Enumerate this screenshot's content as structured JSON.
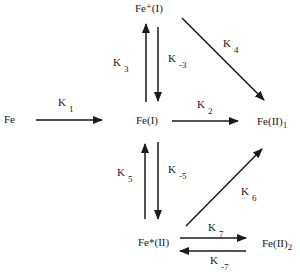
{
  "nodes": {
    "fe": "Fe",
    "fe_i": "Fe(I)",
    "fe_plus_i": "Fe⁺(I)",
    "fe_ii_1": "Fe(II)",
    "fe_ii_1_sub": "1",
    "fe_star_ii": "Fe*(II)",
    "fe_ii_2": "Fe(II)",
    "fe_ii_2_sub": "2"
  },
  "rate_constants": [
    {
      "id": "k1",
      "base": "K",
      "sub": "1",
      "from": "Fe",
      "to": "Fe(I)"
    },
    {
      "id": "k2",
      "base": "K",
      "sub": "2",
      "from": "Fe(I)",
      "to": "Fe(II)1"
    },
    {
      "id": "k3",
      "base": "K",
      "sub": "3",
      "from": "Fe(I)",
      "to": "Fe+(I)"
    },
    {
      "id": "k_3",
      "base": "K",
      "sub": "-3",
      "from": "Fe+(I)",
      "to": "Fe(I)"
    },
    {
      "id": "k4",
      "base": "K",
      "sub": "4",
      "from": "Fe+(I)",
      "to": "Fe(II)1"
    },
    {
      "id": "k5",
      "base": "K",
      "sub": "5",
      "from": "Fe*(II)",
      "to": "Fe(I)"
    },
    {
      "id": "k_5",
      "base": "K",
      "sub": "-5",
      "from": "Fe(I)",
      "to": "Fe*(II)"
    },
    {
      "id": "k6",
      "base": "K",
      "sub": "6",
      "from": "Fe*(II)",
      "to": "Fe(II)1"
    },
    {
      "id": "k7",
      "base": "K",
      "sub": "7",
      "from": "Fe*(II)",
      "to": "Fe(II)2"
    },
    {
      "id": "k_7",
      "base": "K",
      "sub": "-7",
      "from": "Fe(II)2",
      "to": "Fe*(II)"
    }
  ],
  "colors": {
    "ink": "#1a1a1a",
    "background": "#ffffff"
  }
}
